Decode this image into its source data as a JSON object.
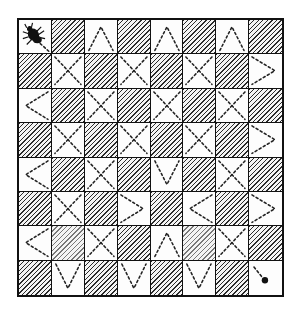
{
  "diagram": {
    "type": "checkerboard-path-puzzle",
    "rows": 8,
    "cols": 8,
    "colors": {
      "line": "#111111",
      "hatch": "#2a2a2a",
      "light": "#fdfdfd",
      "path": "#222222"
    },
    "start": {
      "row": 0,
      "col": 0,
      "marker": "bug-icon"
    },
    "end": {
      "row": 7,
      "col": 7,
      "marker": "dot-icon"
    },
    "legend": {
      "H": "hatched dark square",
      "X": "dashed X (two crossing diagonals)",
      "^": "dashed caret: bottom-left to top-center to bottom-right",
      "v": "dashed vee: top-left to bottom-center to top-right",
      "<": "dashed chevron: top-right to left-middle to bottom-right",
      ">": "dashed chevron: top-left to right-middle to bottom-left",
      "S": "start square with bug and short dashed line toward bottom-right",
      "E": "end square with dot and short dashed line from top-left"
    },
    "grid": [
      [
        "S",
        "H",
        "^",
        "H",
        "^",
        "H",
        "^",
        "H"
      ],
      [
        "H",
        "X",
        "H",
        "X",
        "H",
        "X",
        "H",
        ">"
      ],
      [
        "<",
        "H",
        "X",
        "H",
        "X",
        "H",
        "X",
        "H"
      ],
      [
        "H",
        "X",
        "H",
        "X",
        "H",
        "X",
        "H",
        ">"
      ],
      [
        "<",
        "H",
        "X",
        "H",
        "v",
        "H",
        "X",
        "H"
      ],
      [
        "H",
        "X",
        "H",
        ">",
        "H",
        "<",
        "H",
        ">"
      ],
      [
        "<",
        "Hf",
        "X",
        "H",
        "^",
        "Hf",
        "X",
        "H"
      ],
      [
        "H",
        "v",
        "H",
        "v",
        "H",
        "v",
        "H",
        "E"
      ]
    ]
  }
}
